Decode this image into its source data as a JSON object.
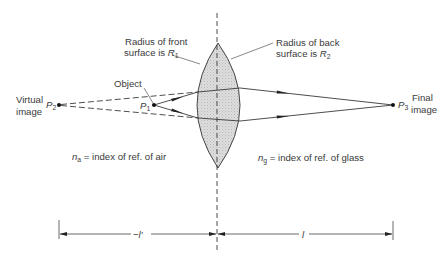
{
  "figure": {
    "labels": {
      "front_radius": {
        "line1": "Radius of front",
        "line2": "surface is ",
        "symbol": "R",
        "sub": "1"
      },
      "back_radius": {
        "line1": "Radius of back",
        "line2": "surface is ",
        "symbol": "R",
        "sub": "2"
      },
      "object": "Object",
      "virtual_image": {
        "line1": "Virtual",
        "line2": "image"
      },
      "final_image": {
        "line1": "Final",
        "line2": "image"
      },
      "p1": {
        "symbol": "P",
        "sub": "1"
      },
      "p2": {
        "symbol": "P",
        "sub": "2"
      },
      "p3": {
        "symbol": "P",
        "sub": "3"
      },
      "air_index": {
        "symbol": "n",
        "sub": "a",
        "text": " = index of ref. of air"
      },
      "glass_index": {
        "symbol": "n",
        "sub": "g",
        "text": " = index of ref. of glass"
      },
      "left_distance": "−l′",
      "right_distance": "l"
    },
    "colors": {
      "line": "#3a3a3a",
      "lens_fill": "#d9d9d9",
      "background": "#ffffff"
    }
  }
}
